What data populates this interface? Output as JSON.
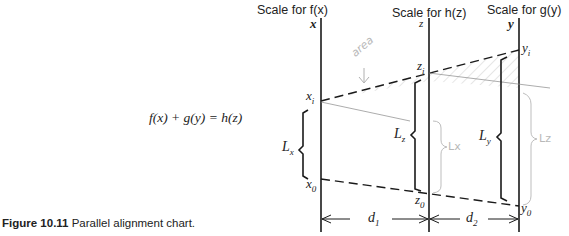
{
  "headers": {
    "fx": "Scale for f(x)",
    "hz": "Scale for h(z)",
    "gy": "Scale for g(y)"
  },
  "axis_labels": {
    "x": "x",
    "z": "z",
    "y": "y"
  },
  "points": {
    "xi": "x",
    "xi_sub": "i",
    "zi": "z",
    "zi_sub": "i",
    "yi": "y",
    "yi_sub": "i",
    "x0": "x",
    "x0_sub": "0",
    "z0": "z",
    "z0_sub": "0",
    "y0": "y",
    "y0_sub": "0"
  },
  "lengths": {
    "Lx": "L",
    "Lx_sub": "x",
    "Lz": "L",
    "Lz_sub": "z",
    "Ly": "L",
    "Ly_sub": "y"
  },
  "distances": {
    "d1": "d",
    "d1_sub": "1",
    "d2": "d",
    "d2_sub": "2"
  },
  "equation": "f(x) + g(y) = h(z)",
  "caption": {
    "number": "Figure 10.11",
    "text": "Parallel alignment chart."
  },
  "handwritten": {
    "area": "area",
    "lx": "Lx",
    "lz": "Lz"
  },
  "colors": {
    "ink": "#1a1a1a",
    "pencil": "#b8b8b8"
  }
}
